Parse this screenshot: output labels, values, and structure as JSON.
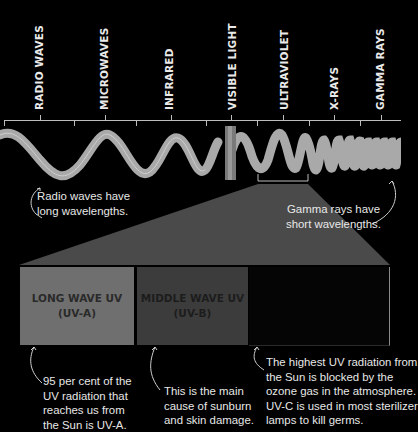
{
  "spectrum": {
    "bands": [
      {
        "label": "RADIO WAVES"
      },
      {
        "label": "MICROWAVES"
      },
      {
        "label": "INFRARED"
      },
      {
        "label": "VISIBLE LIGHT"
      },
      {
        "label": "ULTRAVIOLET"
      },
      {
        "label": "X-RAYS"
      },
      {
        "label": "GAMMA RAYS"
      }
    ],
    "captions": {
      "radio": [
        "Radio waves have",
        "long wavelengths."
      ],
      "gamma": [
        "Gamma rays have",
        "short wavelengths."
      ]
    }
  },
  "uv_types": [
    {
      "title": "LONG WAVE UV",
      "subtitle": "(UV-A)",
      "color": "#6f6f6f",
      "text_color": "#2a2a2a",
      "note": [
        "95 per cent of the",
        "UV radiation that",
        "reaches us from",
        "the Sun is UV-A."
      ]
    },
    {
      "title": "MIDDLE WAVE UV",
      "subtitle": "(UV-B)",
      "color": "#3c3c3c",
      "text_color": "#1c1c1c",
      "note": [
        "This is the main",
        "cause of sunburn",
        "and skin damage."
      ]
    },
    {
      "title": "",
      "subtitle": "",
      "color": "#050505",
      "text_color": "#0a0a0a",
      "note": [
        "The highest UV radiation from",
        "the Sun is blocked by the",
        "ozone gas in the atmosphere.",
        "UV-C is used in most sterilizer",
        "lamps to kill germs."
      ]
    }
  ],
  "colors": {
    "background": "#000000",
    "wave": "#a9a9a9",
    "projection": "#4a4a4a",
    "text": "#e8e8e8"
  }
}
